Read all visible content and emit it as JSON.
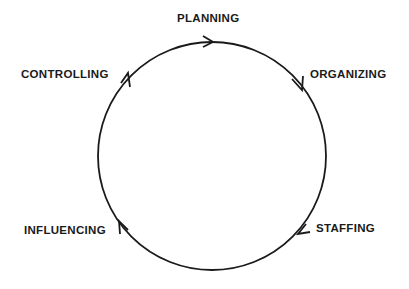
{
  "diagram": {
    "type": "cycle",
    "direction": "clockwise",
    "stages": [
      {
        "label": "PLANNING"
      },
      {
        "label": "ORGANIZING"
      },
      {
        "label": "STAFFING"
      },
      {
        "label": "INFLUENCING"
      },
      {
        "label": "CONTROLLING"
      }
    ],
    "colors": {
      "line": "#1a1a1a",
      "background": "#ffffff"
    }
  }
}
